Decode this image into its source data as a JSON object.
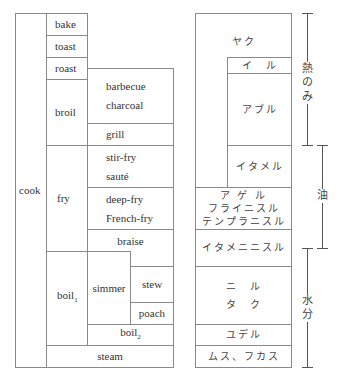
{
  "english": {
    "cook": "cook",
    "bake": "bake",
    "toast": "toast",
    "roast": "roast",
    "broil": "broil",
    "barbecue": "barbecue",
    "charcoal": "charcoal",
    "grill": "grill",
    "fry": "fry",
    "stir_fry": "stir-fry",
    "saute": "sauté",
    "deep_fry": "deep-fry",
    "french_fry": "French-fry",
    "braise": "braise",
    "boil1": "boil",
    "boil1_sub": "1",
    "simmer": "simmer",
    "stew": "stew",
    "poach": "poach",
    "boil2": "boil",
    "boil2_sub": "2",
    "steam": "steam"
  },
  "japanese": {
    "yaku": "ヤク",
    "iru": "イ　ル",
    "aburu": "アブル",
    "itameru": "イタメル",
    "ageru": "ア ゲ ル",
    "furainisuru": "フライニスル",
    "tempuranisuru": "テンプラニスル",
    "itameninisuru": "イタメニニスル",
    "niru": "ニ　ル",
    "taku": "タ　ク",
    "yuderu": "ユデル",
    "musu_fukasu": "ムス、フカス"
  },
  "brackets": {
    "heat_only": [
      "熱",
      "の",
      "み"
    ],
    "oil": [
      "油"
    ],
    "water": [
      "水",
      "分"
    ]
  }
}
